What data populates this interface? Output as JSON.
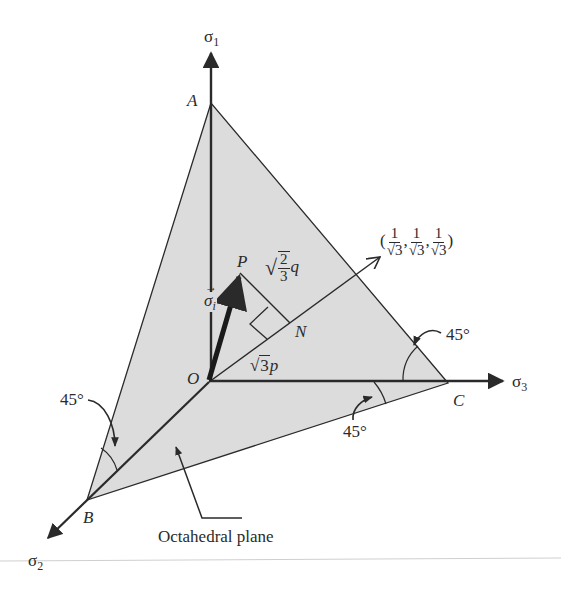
{
  "figure": {
    "colors": {
      "plane_fill": "#dcdcdc",
      "line": "#2a2a2a",
      "background": "#ffffff"
    },
    "axes": {
      "sigma1": {
        "label": "σ",
        "sub": "1"
      },
      "sigma2": {
        "label": "σ",
        "sub": "2"
      },
      "sigma3": {
        "label": "σ",
        "sub": "3"
      }
    },
    "points": {
      "A": "A",
      "B": "B",
      "C": "C",
      "O": "O",
      "P": "P",
      "N": "N"
    },
    "vector_label": {
      "arrow": "→",
      "symbol": "σ",
      "sub": "i"
    },
    "q_label": {
      "sqrt": "√",
      "num": "2",
      "den": "3",
      "var": "q"
    },
    "p_label": {
      "sqrt": "√",
      "rad": "3",
      "var": "p"
    },
    "direction": {
      "open": "(",
      "close": ")",
      "sep": ",",
      "num": "1",
      "sqrt": "√",
      "rad": "3"
    },
    "angles": [
      "45°",
      "45°",
      "45°"
    ],
    "plane_label": "Octahedral plane"
  }
}
